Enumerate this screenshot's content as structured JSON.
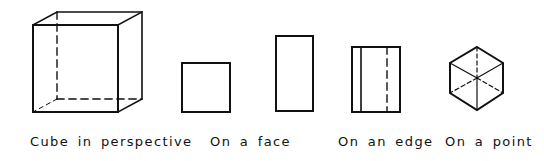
{
  "figures": [
    {
      "id": "perspective",
      "label": "Cube in perspective"
    },
    {
      "id": "face",
      "label": "On a face"
    },
    {
      "id": "edge",
      "label": "On an edge"
    },
    {
      "id": "point",
      "label": "On a point"
    }
  ],
  "colors": {
    "stroke": "#111111",
    "background": "#ffffff"
  }
}
